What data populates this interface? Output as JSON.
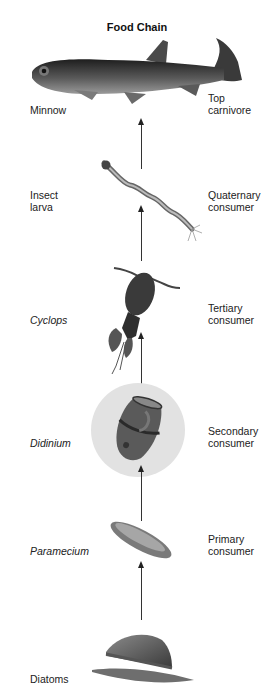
{
  "title": "Food Chain",
  "levels": [
    {
      "organism": "Minnow",
      "organism_italic": false,
      "role_line1": "Top",
      "role_line2": "carnivore",
      "icon": "fish-icon"
    },
    {
      "organism_line1": "Insect",
      "organism_line2": "larva",
      "organism_italic": false,
      "role_line1": "Quaternary",
      "role_line2": "consumer",
      "icon": "insect-larva-icon"
    },
    {
      "organism": "Cyclops",
      "organism_italic": true,
      "role_line1": "Tertiary",
      "role_line2": "consumer",
      "icon": "copepod-icon"
    },
    {
      "organism": "Didinium",
      "organism_italic": true,
      "role_line1": "Secondary",
      "role_line2": "consumer",
      "icon": "ciliate-icon"
    },
    {
      "organism": "Paramecium",
      "organism_italic": true,
      "role_line1": "Primary",
      "role_line2": "consumer",
      "icon": "paramecium-icon"
    },
    {
      "organism": "Diatoms",
      "organism_italic": false,
      "role_line1": "",
      "role_line2": "",
      "icon": "diatom-icon"
    }
  ],
  "colors": {
    "organism_dark": "#3a3a3a",
    "highlight_circle": "#e2e2e2",
    "arrow": "#333333"
  }
}
